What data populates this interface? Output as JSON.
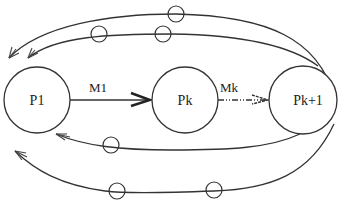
{
  "diagram": {
    "type": "process-pipeline-with-feedback",
    "colors": {
      "stroke": "#333333",
      "background": "#ffffff"
    },
    "nodes": [
      {
        "id": "p1",
        "label": "P1",
        "cx": 37,
        "cy": 100,
        "r": 33
      },
      {
        "id": "pk",
        "label": "Pk",
        "cx": 185,
        "cy": 100,
        "r": 33
      },
      {
        "id": "pk1",
        "label": "Pk+1",
        "cx": 303,
        "cy": 100,
        "r": 34
      }
    ],
    "edges": [
      {
        "id": "m1",
        "label": "M1",
        "from": "P1",
        "to": "Pk",
        "style": "solid-bold-arrow"
      },
      {
        "id": "mk",
        "label": "Mk",
        "from": "Pk",
        "to": "Pk+1",
        "style": "dash-dot-arrow"
      }
    ],
    "feedback_paths": [
      {
        "id": "top-outer",
        "from": "Pk+1",
        "to": "P1",
        "tokens": 1
      },
      {
        "id": "top-inner",
        "from": "Pk+1",
        "to": "P1",
        "tokens": 2
      },
      {
        "id": "bottom-inner",
        "from": "Pk+1",
        "to": "P1",
        "tokens": 1
      },
      {
        "id": "bottom-outer",
        "from": "Pk+1",
        "to": "P1",
        "tokens": 2
      }
    ]
  }
}
